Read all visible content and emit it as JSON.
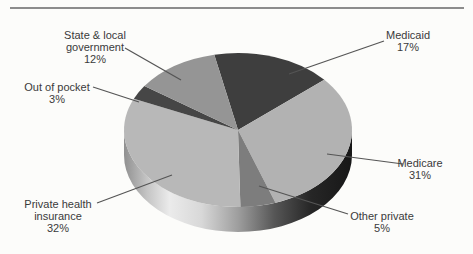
{
  "background_color": "#fcfcfa",
  "top_rule_color": "#8c8c8c",
  "chart_data": {
    "type": "pie",
    "style": "3d",
    "legend_position": "none",
    "labels_style": "callout-with-percent",
    "start_angle_deg": 258,
    "text_color": "#3a3a3a",
    "slices": [
      {
        "label": "Medicaid",
        "pct_label": "17%",
        "value": 17,
        "color": "#3e3e3e"
      },
      {
        "label": "Medicare",
        "pct_label": "31%",
        "value": 31,
        "color": "#b2b2b2"
      },
      {
        "label": "Other private",
        "pct_label": "5%",
        "value": 5,
        "color": "#7d7d7d"
      },
      {
        "label": "Private health insurance",
        "pct_label": "32%",
        "value": 32,
        "color": "#b8b8b8"
      },
      {
        "label": "Out of pocket",
        "pct_label": "3%",
        "value": 3,
        "color": "#464646"
      },
      {
        "label": "State & local government",
        "pct_label": "12%",
        "value": 12,
        "color": "#959595"
      }
    ]
  }
}
